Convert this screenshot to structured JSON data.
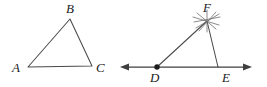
{
  "figure": {
    "title": "Geometry figure: triangle ABC and constructed triangle DFE on a line",
    "background_color": "#ffffff",
    "line_color": "#4a4a4a",
    "axis_color": "#3f3f3f",
    "arc_color": "#6e6e6e",
    "label_color": "#1a1a1a",
    "canvas": {
      "width": 267,
      "height": 87
    }
  },
  "left_figure": {
    "name": "triangle-abc",
    "shape": "triangle",
    "vertices": [
      {
        "id": "A",
        "label": "A",
        "x": 28,
        "y": 67,
        "label_x": 12,
        "label_y": 72
      },
      {
        "id": "B",
        "label": "B",
        "x": 70,
        "y": 19,
        "label_x": 66,
        "label_y": 13
      },
      {
        "id": "C",
        "label": "C",
        "x": 92,
        "y": 66,
        "label_x": 96,
        "label_y": 72
      }
    ],
    "edges": [
      {
        "from": "A",
        "to": "B"
      },
      {
        "from": "B",
        "to": "C"
      },
      {
        "from": "C",
        "to": "A"
      }
    ]
  },
  "right_figure": {
    "name": "triangle-dfe-construction",
    "shape": "triangle-on-line",
    "line": {
      "name": "double-arrow-line-DE",
      "x1": 120,
      "x2": 252,
      "y": 67,
      "left_arrow": true,
      "right_arrow": true
    },
    "vertices": [
      {
        "id": "D",
        "label": "D",
        "x": 157,
        "y": 67,
        "label_x": 150,
        "label_y": 82,
        "has_dot": true
      },
      {
        "id": "E",
        "label": "E",
        "x": 218,
        "y": 67,
        "label_x": 222,
        "label_y": 82,
        "has_dot": false
      },
      {
        "id": "F",
        "label": "F",
        "x": 207,
        "y": 21,
        "label_x": 203,
        "label_y": 12,
        "has_dot": false
      }
    ],
    "edges": [
      {
        "from": "D",
        "to": "F"
      },
      {
        "from": "F",
        "to": "E"
      }
    ],
    "construction_marks": {
      "name": "compass-arc-marks-at-F",
      "center_x": 207,
      "center_y": 21,
      "count": 6,
      "description": "crossing compass arc marks at vertex F"
    }
  }
}
